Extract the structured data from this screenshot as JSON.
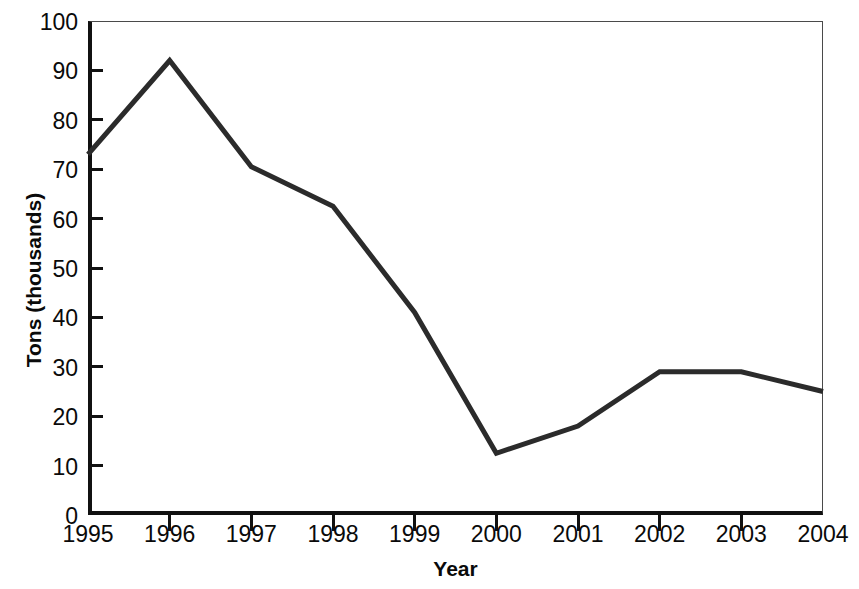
{
  "chart_data": {
    "type": "line",
    "title": "",
    "xlabel": "Year",
    "ylabel": "Tons (thousands)",
    "categories": [
      "1995",
      "1996",
      "1997",
      "1998",
      "1999",
      "2000",
      "2001",
      "2002",
      "2003",
      "2004"
    ],
    "x": [
      1995,
      1996,
      1997,
      1998,
      1999,
      2000,
      2001,
      2002,
      2003,
      2004
    ],
    "values": [
      73,
      92,
      70.5,
      62.5,
      41,
      12.5,
      18,
      29,
      29,
      25
    ],
    "series": [
      {
        "name": "Tons",
        "values": [
          73,
          92,
          70.5,
          62.5,
          41,
          12.5,
          18,
          29,
          29,
          25
        ]
      }
    ],
    "ylim": [
      0,
      100
    ],
    "xlim": [
      1995,
      2004
    ],
    "yticks": [
      0,
      10,
      20,
      30,
      40,
      50,
      60,
      70,
      80,
      90,
      100
    ],
    "ytick_labels": [
      "0",
      "10",
      "20",
      "30",
      "40",
      "50",
      "60",
      "70",
      "80",
      "90",
      "100"
    ],
    "xtick_labels": [
      "1995",
      "1996",
      "1997",
      "1998",
      "1999",
      "2000",
      "2001",
      "2002",
      "2003",
      "2004"
    ],
    "grid": false,
    "legend": null,
    "legend_position": "none",
    "line_color": "#2b2b2b",
    "line_width": 5,
    "axis_color": "#111111",
    "background_color": "#ffffff"
  }
}
